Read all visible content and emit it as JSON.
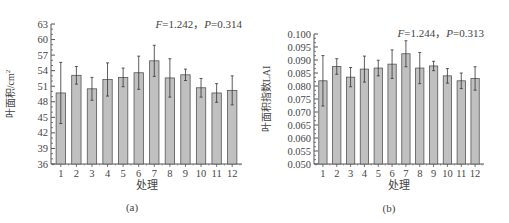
{
  "chart_data": [
    {
      "type": "bar",
      "panel_label": "(a)",
      "annotation": "F=1.242，P=0.314",
      "annotation_parts": {
        "f_label": "F",
        "f_value": "=1.242，",
        "p_label": "P",
        "p_value": "=0.314"
      },
      "title": "",
      "xlabel": "处理",
      "ylabel": "叶面积/cm²",
      "ylabel_main": "叶面积/cm",
      "ylabel_sup": "2",
      "ylim": [
        36,
        63
      ],
      "yticks": [
        36,
        39,
        42,
        45,
        48,
        51,
        54,
        57,
        60,
        63
      ],
      "categories": [
        "1",
        "2",
        "3",
        "4",
        "5",
        "6",
        "7",
        "8",
        "9",
        "10",
        "11",
        "12"
      ],
      "values": [
        49.7,
        53.1,
        50.5,
        52.3,
        52.7,
        53.6,
        55.9,
        52.6,
        53.2,
        50.7,
        49.7,
        50.2
      ],
      "error": [
        5.9,
        1.7,
        2.2,
        3.2,
        1.8,
        3.2,
        3.0,
        3.7,
        1.1,
        1.8,
        1.8,
        2.8
      ],
      "bar_color": "#c0c0c0",
      "grid": false
    },
    {
      "type": "bar",
      "panel_label": "(b)",
      "annotation": "F=1.244，P=0.313",
      "annotation_parts": {
        "f_label": "F",
        "f_value": "=1.244，",
        "p_label": "P",
        "p_value": "=0.313"
      },
      "title": "",
      "xlabel": "处理",
      "ylabel": "叶面积指数LAI",
      "ylim": [
        0.05,
        0.1
      ],
      "yticks": [
        "0.050",
        "0.055",
        "0.060",
        "0.065",
        "0.070",
        "0.075",
        "0.080",
        "0.085",
        "0.090",
        "0.095",
        "0.100"
      ],
      "categories": [
        "1",
        "2",
        "3",
        "4",
        "5",
        "6",
        "7",
        "8",
        "9",
        "10",
        "11",
        "12"
      ],
      "values": [
        0.082,
        0.0875,
        0.0834,
        0.0865,
        0.0869,
        0.0884,
        0.0924,
        0.0869,
        0.0877,
        0.0839,
        0.082,
        0.0829
      ],
      "error": [
        0.0097,
        0.003,
        0.0037,
        0.005,
        0.003,
        0.0055,
        0.005,
        0.006,
        0.0018,
        0.0028,
        0.003,
        0.0045
      ],
      "bar_color": "#c0c0c0",
      "grid": false
    }
  ]
}
